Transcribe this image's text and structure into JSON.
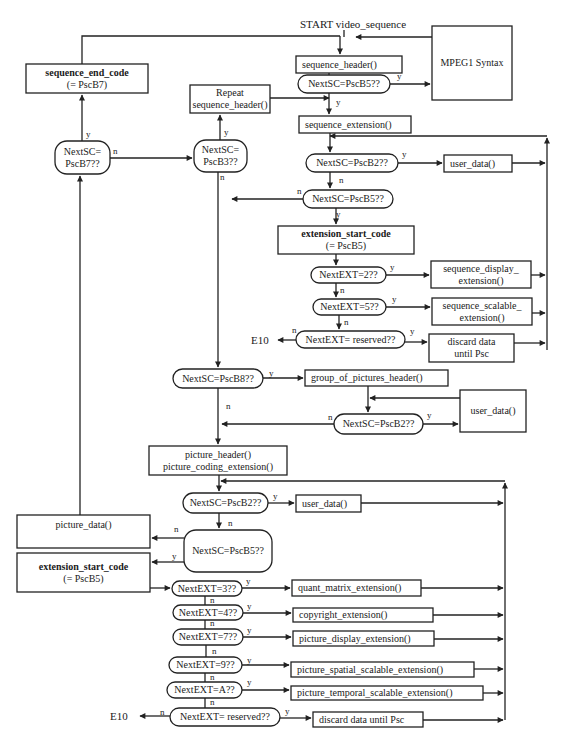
{
  "diagram": {
    "start_label": "START video_sequence",
    "exit_label": "E10",
    "colors": {
      "line": "#222222",
      "text": "#1a1a1a",
      "background": "#ffffff"
    },
    "nodes": [
      {
        "id": "sequence_header",
        "type": "process",
        "lines": [
          "sequence_header()"
        ],
        "x": 296,
        "y": 56,
        "w": 106,
        "h": 17,
        "align": "left"
      },
      {
        "id": "mpeg1_syntax",
        "type": "process",
        "lines": [
          "MPEG1 Syntax"
        ],
        "x": 432,
        "y": 26,
        "w": 80,
        "h": 74,
        "align": "center"
      },
      {
        "id": "dec_seq_b5",
        "type": "decision",
        "lines": [
          "NextSC=PscB5??"
        ],
        "x": 298,
        "y": 75,
        "w": 92,
        "h": 18
      },
      {
        "id": "sequence_end_code",
        "type": "process",
        "lines": [
          "sequence_end_code",
          "(= PscB7)"
        ],
        "x": 26,
        "y": 64,
        "w": 122,
        "h": 29,
        "bold_first": true
      },
      {
        "id": "repeat_sequence_header",
        "type": "process",
        "lines": [
          "Repeat",
          "sequence_header()"
        ],
        "x": 190,
        "y": 85,
        "w": 80,
        "h": 28
      },
      {
        "id": "dec_b7",
        "type": "decision",
        "lines": [
          "NextSC=",
          "PscB7??"
        ],
        "x": 55,
        "y": 141,
        "w": 55,
        "h": 33
      },
      {
        "id": "dec_b3",
        "type": "decision",
        "lines": [
          "NextSC=",
          "PscB3??"
        ],
        "x": 194,
        "y": 140,
        "w": 53,
        "h": 32
      },
      {
        "id": "sequence_extension",
        "type": "process",
        "lines": [
          "sequence_extension()"
        ],
        "x": 299,
        "y": 116,
        "w": 112,
        "h": 17,
        "align": "left"
      },
      {
        "id": "dec_seq_b2",
        "type": "decision",
        "lines": [
          "NextSC=PscB2??"
        ],
        "x": 306,
        "y": 154,
        "w": 92,
        "h": 18
      },
      {
        "id": "seq_user_data",
        "type": "process",
        "lines": [
          "user_data()"
        ],
        "x": 444,
        "y": 155,
        "w": 68,
        "h": 17,
        "align": "left"
      },
      {
        "id": "dec_seq_b5b",
        "type": "decision",
        "lines": [
          "NextSC=PscB5??"
        ],
        "x": 303,
        "y": 190,
        "w": 90,
        "h": 18
      },
      {
        "id": "seq_extension_start_code",
        "type": "process",
        "lines": [
          "extension_start_code",
          "(= PscB5)"
        ],
        "x": 278,
        "y": 226,
        "w": 136,
        "h": 28,
        "bold_first": true
      },
      {
        "id": "dec_ext_2",
        "type": "decision",
        "lines": [
          "NextEXT=2??"
        ],
        "x": 311,
        "y": 267,
        "w": 75,
        "h": 16
      },
      {
        "id": "sequence_display_extension",
        "type": "process",
        "lines": [
          "sequence_display_",
          "extension()"
        ],
        "x": 431,
        "y": 261,
        "w": 100,
        "h": 27
      },
      {
        "id": "dec_ext_5",
        "type": "decision",
        "lines": [
          "NextEXT=5??"
        ],
        "x": 313,
        "y": 299,
        "w": 73,
        "h": 16
      },
      {
        "id": "sequence_scalable_extension",
        "type": "process",
        "lines": [
          "sequence_scalable_",
          "extension()"
        ],
        "x": 432,
        "y": 298,
        "w": 100,
        "h": 27
      },
      {
        "id": "dec_seq_reserved",
        "type": "decision",
        "lines": [
          "NextEXT= reserved??"
        ],
        "x": 296,
        "y": 331,
        "w": 109,
        "h": 17
      },
      {
        "id": "seq_discard",
        "type": "process",
        "lines": [
          "discard data",
          "until Psc"
        ],
        "x": 429,
        "y": 334,
        "w": 85,
        "h": 28
      },
      {
        "id": "dec_b8",
        "type": "decision",
        "lines": [
          "NextSC=PscB8??"
        ],
        "x": 173,
        "y": 369,
        "w": 90,
        "h": 19
      },
      {
        "id": "group_of_pictures_header",
        "type": "process",
        "lines": [
          "group_of_pictures_header()"
        ],
        "x": 305,
        "y": 370,
        "w": 143,
        "h": 16,
        "align": "left"
      },
      {
        "id": "gop_user_data",
        "type": "process",
        "lines": [
          "user_data()"
        ],
        "x": 460,
        "y": 390,
        "w": 66,
        "h": 42
      },
      {
        "id": "dec_gop_b2",
        "type": "decision",
        "lines": [
          "NextSC=PscB2??"
        ],
        "x": 334,
        "y": 414,
        "w": 89,
        "h": 20
      },
      {
        "id": "picture_header",
        "type": "process",
        "lines": [
          "picture_header()",
          "picture_coding_extension()"
        ],
        "x": 149,
        "y": 446,
        "w": 138,
        "h": 29
      },
      {
        "id": "dec_pic_b2",
        "type": "decision",
        "lines": [
          "NextSC=PscB2??"
        ],
        "x": 183,
        "y": 493,
        "w": 85,
        "h": 20
      },
      {
        "id": "pic_user_data",
        "type": "process",
        "lines": [
          "user_data()"
        ],
        "x": 296,
        "y": 495,
        "w": 65,
        "h": 17,
        "align": "left"
      },
      {
        "id": "picture_data",
        "type": "process",
        "lines": [
          "picture_data()"
        ],
        "x": 17,
        "y": 515,
        "w": 133,
        "h": 33,
        "text_top": true
      },
      {
        "id": "dec_pic_b5",
        "type": "decision",
        "lines": [
          "NextSC=PscB5??"
        ],
        "x": 184,
        "y": 530,
        "w": 88,
        "h": 42
      },
      {
        "id": "pic_extension_start_code",
        "type": "process",
        "lines": [
          "extension_start_code",
          "(= PscB5)"
        ],
        "x": 17,
        "y": 553,
        "w": 133,
        "h": 39,
        "bold_first": true
      },
      {
        "id": "dec_ext_3",
        "type": "decision",
        "lines": [
          "NextEXT=3??"
        ],
        "x": 172,
        "y": 581,
        "w": 70,
        "h": 15
      },
      {
        "id": "quant_matrix_extension",
        "type": "process",
        "lines": [
          "quant_matrix_extension()"
        ],
        "x": 292,
        "y": 580,
        "w": 129,
        "h": 16,
        "align": "left"
      },
      {
        "id": "dec_ext_4",
        "type": "decision",
        "lines": [
          "NextEXT=4??"
        ],
        "x": 173,
        "y": 605,
        "w": 70,
        "h": 15
      },
      {
        "id": "copyright_extension",
        "type": "process",
        "lines": [
          "copyright_extension()"
        ],
        "x": 293,
        "y": 608,
        "w": 140,
        "h": 14,
        "align": "left"
      },
      {
        "id": "dec_ext_7",
        "type": "decision",
        "lines": [
          "NextEXT=7??"
        ],
        "x": 173,
        "y": 629,
        "w": 70,
        "h": 16
      },
      {
        "id": "picture_display_extension",
        "type": "process",
        "lines": [
          "picture_display_extension()"
        ],
        "x": 293,
        "y": 631,
        "w": 141,
        "h": 15,
        "align": "left"
      },
      {
        "id": "dec_ext_9",
        "type": "decision",
        "lines": [
          "NextEXT=9??"
        ],
        "x": 169,
        "y": 657,
        "w": 73,
        "h": 16
      },
      {
        "id": "picture_spatial_scalable_extension",
        "type": "process",
        "lines": [
          "picture_spatial_scalable_extension()"
        ],
        "x": 291,
        "y": 662,
        "w": 183,
        "h": 15,
        "align": "left"
      },
      {
        "id": "dec_ext_a",
        "type": "decision",
        "lines": [
          "NextEXT=A??"
        ],
        "x": 167,
        "y": 682,
        "w": 75,
        "h": 16
      },
      {
        "id": "picture_temporal_scalable_extension",
        "type": "process",
        "lines": [
          "picture_temporal_scalable_extension()"
        ],
        "x": 291,
        "y": 686,
        "w": 192,
        "h": 14,
        "align": "left"
      },
      {
        "id": "dec_pic_reserved",
        "type": "decision",
        "lines": [
          "NextEXT= reserved??"
        ],
        "x": 170,
        "y": 708,
        "w": 110,
        "h": 18
      },
      {
        "id": "pic_discard",
        "type": "process",
        "lines": [
          "discard data until Psc"
        ],
        "x": 313,
        "y": 712,
        "w": 110,
        "h": 15,
        "align": "left"
      }
    ],
    "labels": [
      {
        "text": "y",
        "x": 397,
        "y": 79
      },
      {
        "text": "n",
        "x": 394,
        "y": 82,
        "alt": true
      },
      {
        "text": "y",
        "x": 336,
        "y": 105
      },
      {
        "text": "y",
        "x": 86,
        "y": 137
      },
      {
        "text": "n",
        "x": 113,
        "y": 154
      },
      {
        "text": "y",
        "x": 224,
        "y": 135
      },
      {
        "text": "n",
        "x": 220,
        "y": 180
      },
      {
        "text": "y",
        "x": 402,
        "y": 157
      },
      {
        "text": "n",
        "x": 339,
        "y": 183
      },
      {
        "text": "n",
        "x": 297,
        "y": 194
      },
      {
        "text": "y",
        "x": 336,
        "y": 217
      },
      {
        "text": "y",
        "x": 390,
        "y": 270
      },
      {
        "text": "n",
        "x": 340,
        "y": 293
      },
      {
        "text": "y",
        "x": 392,
        "y": 302
      },
      {
        "text": "n",
        "x": 344,
        "y": 325
      },
      {
        "text": "n",
        "x": 292,
        "y": 333
      },
      {
        "text": "y",
        "x": 410,
        "y": 334
      },
      {
        "text": "y",
        "x": 269,
        "y": 376
      },
      {
        "text": "n",
        "x": 226,
        "y": 409
      },
      {
        "text": "n",
        "x": 328,
        "y": 420
      },
      {
        "text": "y",
        "x": 427,
        "y": 418
      },
      {
        "text": "y",
        "x": 273,
        "y": 499
      },
      {
        "text": "n",
        "x": 228,
        "y": 526
      },
      {
        "text": "n",
        "x": 174,
        "y": 532
      },
      {
        "text": "y",
        "x": 172,
        "y": 559
      },
      {
        "text": "y",
        "x": 246,
        "y": 584
      },
      {
        "text": "n",
        "x": 210,
        "y": 603
      },
      {
        "text": "y",
        "x": 247,
        "y": 609
      },
      {
        "text": "n",
        "x": 210,
        "y": 626
      },
      {
        "text": "y",
        "x": 247,
        "y": 633
      },
      {
        "text": "n",
        "x": 212,
        "y": 654
      },
      {
        "text": "y",
        "x": 247,
        "y": 663
      },
      {
        "text": "n",
        "x": 210,
        "y": 680
      },
      {
        "text": "y",
        "x": 247,
        "y": 685
      },
      {
        "text": "n",
        "x": 210,
        "y": 705
      },
      {
        "text": "n",
        "x": 160,
        "y": 715
      },
      {
        "text": "y",
        "x": 285,
        "y": 714
      }
    ]
  }
}
